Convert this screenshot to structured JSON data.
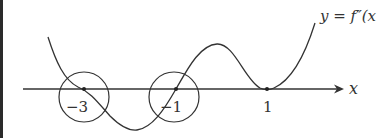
{
  "diagram": {
    "curve_label": "y = f″(x",
    "axis_label": "x",
    "points": [
      {
        "label": "−3",
        "x_value": -3,
        "circled": true
      },
      {
        "label": "−1",
        "x_value": -1,
        "circled": true
      },
      {
        "label": "1",
        "x_value": 1,
        "circled": false
      }
    ],
    "colors": {
      "stroke": "#333333",
      "background": "#ffffff"
    }
  }
}
